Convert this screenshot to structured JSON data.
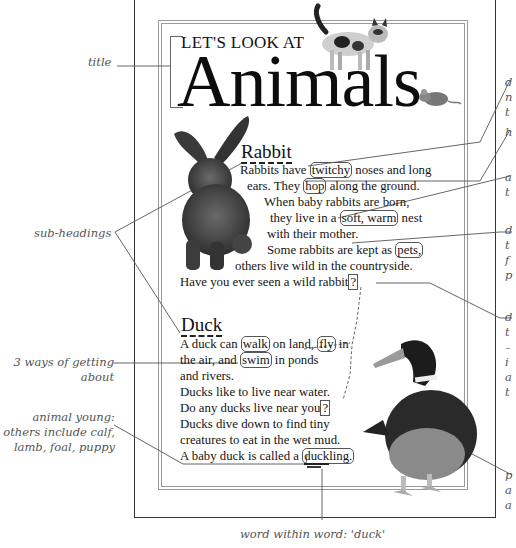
{
  "title": {
    "small": "LET'S LOOK AT",
    "big": "Animals"
  },
  "rabbit": {
    "heading": "Rabbit",
    "lines": [
      {
        "pre": "Rabbits have ",
        "box": "twitchy",
        "post": " noses and long"
      },
      {
        "pre": "ears. They ",
        "box": "hop",
        "post": " along the ground."
      },
      {
        "pre": "When baby rabbits are born,",
        "box": "",
        "post": ""
      },
      {
        "pre": "they live in a ",
        "box": "soft, warm",
        "post": " nest"
      },
      {
        "pre": "with their mother.",
        "box": "",
        "post": ""
      },
      {
        "pre": "Some rabbits are kept as ",
        "box": "pets,",
        "post": ""
      },
      {
        "pre": "others live wild in the countryside.",
        "box": "",
        "post": ""
      },
      {
        "pre": "Have you ever seen a wild rabbit",
        "box": "?",
        "post": ""
      }
    ]
  },
  "duck": {
    "heading": "Duck",
    "line1": {
      "a": "A duck can ",
      "b": "walk",
      "c": " on land, ",
      "d": "fly",
      "e": " in"
    },
    "line2": {
      "a": "the air, and ",
      "b": "swim",
      "c": " in ponds"
    },
    "line3": "and rivers.",
    "line4": "Ducks like to live near water.",
    "line5": {
      "a": "Do any ducks live near you",
      "b": "?"
    },
    "line6": "Ducks dive down to find tiny",
    "line7": "creatures to eat in the wet mud.",
    "line8": {
      "a": "A baby duck is called a ",
      "b": "duck",
      "c": "ling."
    }
  },
  "annotations_left": {
    "title": "title",
    "subheadings": "sub-headings",
    "ways": [
      "3 ways of getting",
      "about"
    ],
    "young": [
      "animal young:",
      "others include calf,",
      "lamb, foal, puppy"
    ]
  },
  "annotation_bottom": "word within word: 'duck'",
  "annotations_right_fragments": [
    [
      "d",
      "n",
      "t"
    ],
    [
      "h"
    ],
    [
      "a",
      "t"
    ],
    [
      "d",
      "t",
      "f",
      "p"
    ],
    [
      "d",
      "t",
      "–",
      "i",
      "a",
      "t"
    ],
    [
      "p",
      "a",
      "a"
    ]
  ],
  "images": {
    "cat": "cat-photo",
    "mouse": "mouse-photo",
    "rabbit": "rabbit-photo",
    "duck": "duck-photo"
  },
  "colors": {
    "text": "#151515",
    "annotation": "#555555",
    "frame": "#999999",
    "page_border": "#333333"
  }
}
